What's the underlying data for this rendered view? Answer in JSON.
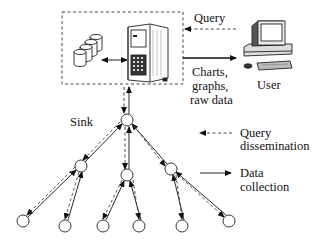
{
  "diagram": {
    "labels": {
      "query": "Query",
      "charts_line1": "Charts,",
      "charts_line2": "graphs,",
      "charts_line3": "raw data",
      "user": "User",
      "sink": "Sink"
    },
    "legend": {
      "query_dissemination_line1": "Query",
      "query_dissemination_line2": "dissemination",
      "data_collection_line1": "Data",
      "data_collection_line2": "collection"
    },
    "nodes": {
      "sink": [
        127,
        120
      ],
      "mid": [
        [
          81,
          166
        ],
        [
          127,
          175
        ],
        [
          171,
          169
        ]
      ],
      "leaf": [
        [
          23,
          221
        ],
        [
          65,
          226
        ],
        [
          103,
          226
        ],
        [
          139,
          226
        ],
        [
          182,
          226
        ],
        [
          229,
          221
        ]
      ]
    }
  }
}
